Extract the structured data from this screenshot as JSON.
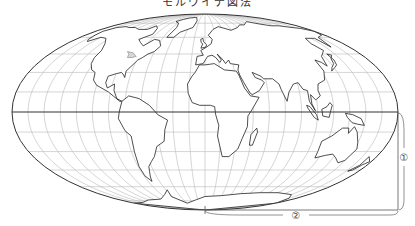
{
  "title": "モルワイデ図法",
  "projection": "mollweide",
  "graticule": {
    "meridian_step_deg": 15,
    "parallel_step_deg": 15
  },
  "annotations": [
    {
      "id": "1",
      "label": "①",
      "meaning": "distance from equator to pole (vertical)"
    },
    {
      "id": "2",
      "label": "②",
      "meaning": "distance from central meridian to edge along bottom"
    }
  ],
  "colors": {
    "outline": "#333333",
    "graticule": "#b8b8b8",
    "equator": "#333333",
    "coast": "#222222",
    "ice": "#d8d8d8"
  },
  "continents": [
    {
      "name": "north-america",
      "coords": [
        [
          -168,
          66
        ],
        [
          -162,
          70
        ],
        [
          -150,
          71
        ],
        [
          -140,
          70
        ],
        [
          -128,
          70
        ],
        [
          -115,
          68
        ],
        [
          -100,
          68
        ],
        [
          -95,
          72
        ],
        [
          -85,
          69
        ],
        [
          -80,
          63
        ],
        [
          -92,
          58
        ],
        [
          -85,
          55
        ],
        [
          -78,
          52
        ],
        [
          -70,
          58
        ],
        [
          -62,
          57
        ],
        [
          -56,
          52
        ],
        [
          -60,
          47
        ],
        [
          -66,
          45
        ],
        [
          -70,
          42
        ],
        [
          -74,
          40
        ],
        [
          -76,
          37
        ],
        [
          -81,
          31
        ],
        [
          -80,
          26
        ],
        [
          -82,
          28
        ],
        [
          -85,
          30
        ],
        [
          -90,
          29
        ],
        [
          -97,
          27
        ],
        [
          -97,
          22
        ],
        [
          -94,
          18
        ],
        [
          -88,
          21
        ],
        [
          -87,
          16
        ],
        [
          -83,
          10
        ],
        [
          -78,
          8
        ],
        [
          -80,
          8
        ],
        [
          -85,
          11
        ],
        [
          -92,
          15
        ],
        [
          -105,
          20
        ],
        [
          -110,
          24
        ],
        [
          -112,
          30
        ],
        [
          -117,
          32
        ],
        [
          -122,
          37
        ],
        [
          -124,
          42
        ],
        [
          -124,
          48
        ],
        [
          -130,
          54
        ],
        [
          -140,
          59
        ],
        [
          -150,
          60
        ],
        [
          -158,
          56
        ],
        [
          -162,
          58
        ],
        [
          -165,
          62
        ]
      ]
    },
    {
      "name": "greenland",
      "coords": [
        [
          -55,
          60
        ],
        [
          -45,
          60
        ],
        [
          -40,
          65
        ],
        [
          -22,
          70
        ],
        [
          -20,
          78
        ],
        [
          -30,
          83
        ],
        [
          -50,
          82
        ],
        [
          -62,
          80
        ],
        [
          -70,
          77
        ],
        [
          -58,
          75
        ],
        [
          -52,
          70
        ]
      ]
    },
    {
      "name": "south-america",
      "coords": [
        [
          -78,
          8
        ],
        [
          -72,
          12
        ],
        [
          -62,
          10
        ],
        [
          -52,
          5
        ],
        [
          -44,
          -2
        ],
        [
          -35,
          -6
        ],
        [
          -38,
          -13
        ],
        [
          -40,
          -22
        ],
        [
          -48,
          -26
        ],
        [
          -53,
          -34
        ],
        [
          -58,
          -38
        ],
        [
          -63,
          -42
        ],
        [
          -65,
          -46
        ],
        [
          -68,
          -51
        ],
        [
          -70,
          -55
        ],
        [
          -74,
          -50
        ],
        [
          -74,
          -42
        ],
        [
          -72,
          -30
        ],
        [
          -71,
          -18
        ],
        [
          -76,
          -14
        ],
        [
          -81,
          -5
        ],
        [
          -80,
          0
        ]
      ]
    },
    {
      "name": "africa",
      "coords": [
        [
          -17,
          21
        ],
        [
          -16,
          14
        ],
        [
          -12,
          7
        ],
        [
          -5,
          5
        ],
        [
          5,
          5
        ],
        [
          9,
          4
        ],
        [
          10,
          -2
        ],
        [
          13,
          -10
        ],
        [
          12,
          -18
        ],
        [
          18,
          -34
        ],
        [
          25,
          -34
        ],
        [
          33,
          -28
        ],
        [
          36,
          -20
        ],
        [
          40,
          -11
        ],
        [
          40,
          -3
        ],
        [
          44,
          2
        ],
        [
          51,
          11
        ],
        [
          43,
          12
        ],
        [
          38,
          18
        ],
        [
          34,
          28
        ],
        [
          32,
          31
        ],
        [
          20,
          32
        ],
        [
          10,
          37
        ],
        [
          0,
          36
        ],
        [
          -6,
          36
        ],
        [
          -10,
          30
        ],
        [
          -13,
          27
        ]
      ]
    },
    {
      "name": "madagascar",
      "coords": [
        [
          44,
          -25
        ],
        [
          47,
          -25
        ],
        [
          50,
          -15
        ],
        [
          49,
          -12
        ],
        [
          44,
          -17
        ]
      ]
    },
    {
      "name": "eurasia",
      "coords": [
        [
          -10,
          36
        ],
        [
          -9,
          43
        ],
        [
          -2,
          44
        ],
        [
          -5,
          48
        ],
        [
          2,
          51
        ],
        [
          8,
          54
        ],
        [
          10,
          58
        ],
        [
          5,
          62
        ],
        [
          14,
          68
        ],
        [
          25,
          71
        ],
        [
          40,
          68
        ],
        [
          44,
          67
        ],
        [
          60,
          70
        ],
        [
          70,
          73
        ],
        [
          80,
          73
        ],
        [
          100,
          77
        ],
        [
          115,
          74
        ],
        [
          130,
          72
        ],
        [
          145,
          72
        ],
        [
          160,
          70
        ],
        [
          170,
          69
        ],
        [
          180,
          66
        ],
        [
          175,
          62
        ],
        [
          163,
          60
        ],
        [
          157,
          51
        ],
        [
          155,
          59
        ],
        [
          142,
          59
        ],
        [
          138,
          54
        ],
        [
          142,
          48
        ],
        [
          132,
          43
        ],
        [
          129,
          35
        ],
        [
          126,
          38
        ],
        [
          121,
          40
        ],
        [
          122,
          31
        ],
        [
          118,
          24
        ],
        [
          110,
          21
        ],
        [
          108,
          16
        ],
        [
          109,
          12
        ],
        [
          104,
          9
        ],
        [
          100,
          13
        ],
        [
          100,
          6
        ],
        [
          103,
          1
        ],
        [
          98,
          8
        ],
        [
          98,
          16
        ],
        [
          94,
          17
        ],
        [
          91,
          22
        ],
        [
          86,
          21
        ],
        [
          80,
          15
        ],
        [
          77,
          8
        ],
        [
          73,
          17
        ],
        [
          72,
          21
        ],
        [
          67,
          25
        ],
        [
          58,
          25
        ],
        [
          56,
          27
        ],
        [
          48,
          30
        ],
        [
          50,
          26
        ],
        [
          56,
          24
        ],
        [
          58,
          22
        ],
        [
          52,
          16
        ],
        [
          45,
          13
        ],
        [
          43,
          14
        ],
        [
          38,
          22
        ],
        [
          35,
          28
        ],
        [
          34,
          32
        ],
        [
          36,
          36
        ],
        [
          27,
          37
        ],
        [
          26,
          40
        ],
        [
          22,
          37
        ],
        [
          20,
          40
        ],
        [
          14,
          45
        ],
        [
          18,
          40
        ],
        [
          16,
          38
        ],
        [
          12,
          42
        ],
        [
          8,
          44
        ],
        [
          3,
          43
        ],
        [
          -2,
          37
        ]
      ]
    },
    {
      "name": "britain",
      "coords": [
        [
          -5,
          50
        ],
        [
          1,
          51
        ],
        [
          2,
          53
        ],
        [
          -2,
          56
        ],
        [
          -3,
          59
        ],
        [
          -6,
          58
        ],
        [
          -5,
          55
        ],
        [
          -3,
          54
        ]
      ]
    },
    {
      "name": "japan",
      "coords": [
        [
          130,
          31
        ],
        [
          136,
          34
        ],
        [
          140,
          36
        ],
        [
          142,
          40
        ],
        [
          141,
          45
        ],
        [
          145,
          44
        ],
        [
          140,
          41
        ],
        [
          138,
          37
        ],
        [
          133,
          34
        ]
      ]
    },
    {
      "name": "borneo",
      "coords": [
        [
          109,
          2
        ],
        [
          114,
          4
        ],
        [
          117,
          7
        ],
        [
          119,
          5
        ],
        [
          117,
          0
        ],
        [
          116,
          -4
        ],
        [
          110,
          -3
        ]
      ]
    },
    {
      "name": "sumatra",
      "coords": [
        [
          95,
          5
        ],
        [
          98,
          4
        ],
        [
          104,
          -2
        ],
        [
          106,
          -6
        ],
        [
          102,
          -4
        ],
        [
          96,
          3
        ]
      ]
    },
    {
      "name": "new-guinea",
      "coords": [
        [
          131,
          -1
        ],
        [
          138,
          -2
        ],
        [
          146,
          -5
        ],
        [
          150,
          -10
        ],
        [
          143,
          -9
        ],
        [
          138,
          -8
        ],
        [
          133,
          -4
        ]
      ]
    },
    {
      "name": "australia",
      "coords": [
        [
          114,
          -22
        ],
        [
          122,
          -18
        ],
        [
          130,
          -12
        ],
        [
          136,
          -12
        ],
        [
          137,
          -16
        ],
        [
          141,
          -11
        ],
        [
          145,
          -15
        ],
        [
          150,
          -23
        ],
        [
          153,
          -28
        ],
        [
          150,
          -37
        ],
        [
          145,
          -39
        ],
        [
          138,
          -35
        ],
        [
          132,
          -32
        ],
        [
          125,
          -33
        ],
        [
          116,
          -35
        ],
        [
          115,
          -30
        ]
      ]
    },
    {
      "name": "new-zealand",
      "coords": [
        [
          172,
          -34
        ],
        [
          178,
          -38
        ],
        [
          174,
          -41
        ],
        [
          171,
          -45
        ],
        [
          167,
          -46
        ],
        [
          172,
          -41
        ]
      ]
    },
    {
      "name": "antarctica",
      "coords": [
        [
          -180,
          -78
        ],
        [
          -150,
          -77
        ],
        [
          -120,
          -74
        ],
        [
          -90,
          -73
        ],
        [
          -70,
          -68
        ],
        [
          -58,
          -63
        ],
        [
          -62,
          -70
        ],
        [
          -45,
          -78
        ],
        [
          -20,
          -74
        ],
        [
          0,
          -70
        ],
        [
          30,
          -69
        ],
        [
          60,
          -67
        ],
        [
          90,
          -66
        ],
        [
          120,
          -66
        ],
        [
          150,
          -68
        ],
        [
          165,
          -72
        ],
        [
          180,
          -78
        ],
        [
          180,
          -90
        ],
        [
          -180,
          -90
        ]
      ]
    }
  ],
  "ice_regions": [
    {
      "name": "great-lakes",
      "coords": [
        [
          -92,
          47
        ],
        [
          -84,
          46
        ],
        [
          -80,
          44
        ],
        [
          -78,
          43
        ],
        [
          -82,
          42
        ],
        [
          -87,
          42
        ],
        [
          -88,
          45
        ]
      ]
    }
  ]
}
